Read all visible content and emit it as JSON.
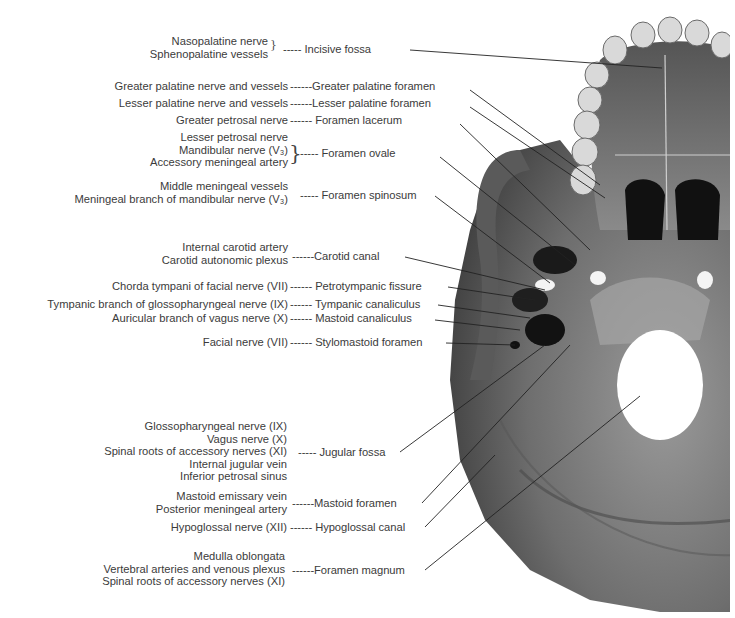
{
  "figure": {
    "style": "grayscale anatomical illustration"
  },
  "foramina": [
    {
      "id": "incisive",
      "name": "Incisive fossa",
      "contents": [
        "Nasopalatine nerve",
        "Sphenopalatine vessels"
      ]
    },
    {
      "id": "greater-palatine",
      "name": "Greater palatine foramen",
      "contents": [
        "Greater palatine nerve and vessels"
      ]
    },
    {
      "id": "lesser-palatine",
      "name": "Lesser palatine foramen",
      "contents": [
        "Lesser palatine nerve and vessels"
      ]
    },
    {
      "id": "lacerum",
      "name": "Foramen lacerum",
      "contents": [
        "Greater petrosal nerve"
      ]
    },
    {
      "id": "ovale",
      "name": "Foramen ovale",
      "contents": [
        "Lesser petrosal nerve",
        "Mandibular nerve (V₃)",
        "Accessory meningeal artery"
      ]
    },
    {
      "id": "spinosum",
      "name": "Foramen spinosum",
      "contents": [
        "Middle meningeal vessels",
        "Meningeal branch of mandibular nerve (V₃)"
      ]
    },
    {
      "id": "carotid",
      "name": "Carotid canal",
      "contents": [
        "Internal carotid artery",
        "Carotid autonomic plexus"
      ]
    },
    {
      "id": "petrotympanic",
      "name": "Petrotympanic fissure",
      "contents": [
        "Chorda tympani of facial nerve (VII)"
      ]
    },
    {
      "id": "tympanic-canaliculus",
      "name": "Tympanic canaliculus",
      "contents": [
        "Tympanic branch of glossopharyngeal nerve (IX)"
      ]
    },
    {
      "id": "mastoid-canaliculus",
      "name": "Mastoid canaliculus",
      "contents": [
        "Auricular branch of vagus nerve (X)"
      ]
    },
    {
      "id": "stylomastoid",
      "name": "Stylomastoid foramen",
      "contents": [
        "Facial nerve (VII)"
      ]
    },
    {
      "id": "jugular",
      "name": "Jugular fossa",
      "contents": [
        "Glossopharyngeal nerve (IX)",
        "Vagus nerve (X)",
        "Spinal roots of accessory nerves (XI)",
        "Internal jugular vein",
        "Inferior petrosal sinus"
      ]
    },
    {
      "id": "mastoid-foramen",
      "name": "Mastoid foramen",
      "contents": [
        "Mastoid emissary vein",
        "Posterior meningeal artery"
      ]
    },
    {
      "id": "hypoglossal",
      "name": "Hypoglossal canal",
      "contents": [
        "Hypoglossal nerve (XII)"
      ]
    },
    {
      "id": "magnum",
      "name": "Foramen magnum",
      "contents": [
        "Medulla oblongata",
        "Vertebral arteries and venous plexus",
        "Spinal roots of accessory nerves (XI)"
      ]
    }
  ],
  "dashes": {
    "short": "-----",
    "long": "------"
  }
}
